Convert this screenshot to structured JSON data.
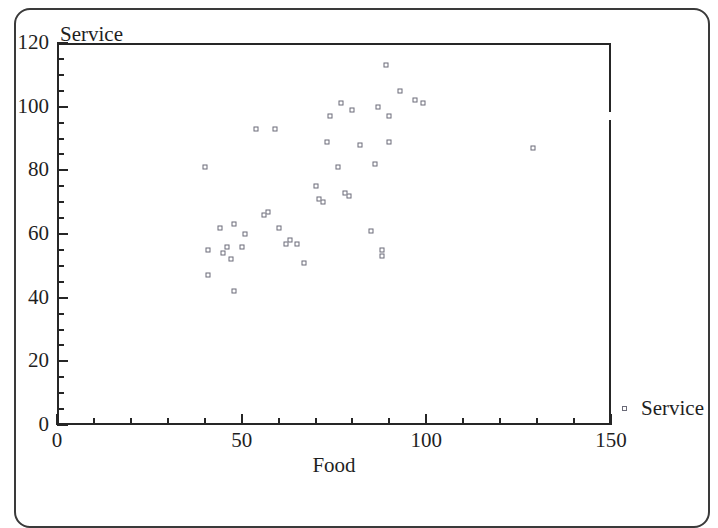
{
  "figure": {
    "title": "",
    "y_axis_title": "Service",
    "x_axis_title": "Food",
    "legend": [
      {
        "marker": "open-square-marker",
        "label": "Service"
      }
    ]
  },
  "chart_data": {
    "type": "scatter",
    "title": "",
    "xlabel": "Food",
    "ylabel": "Service",
    "xlim": [
      0,
      150
    ],
    "ylim": [
      0,
      120
    ],
    "x_major_ticks": [
      0,
      50,
      100,
      150
    ],
    "y_major_ticks": [
      0,
      20,
      40,
      60,
      80,
      100,
      120
    ],
    "x_minor_tick_step": 10,
    "y_minor_tick_step": 5,
    "grid": false,
    "legend_position": "right",
    "marker": "open square",
    "marker_color": "#6b6b78",
    "series": [
      {
        "name": "Service",
        "points": [
          [
            40,
            81
          ],
          [
            41,
            55
          ],
          [
            41,
            47
          ],
          [
            44,
            62
          ],
          [
            45,
            54
          ],
          [
            46,
            56
          ],
          [
            47,
            52
          ],
          [
            48,
            63
          ],
          [
            48,
            42
          ],
          [
            50,
            56
          ],
          [
            51,
            60
          ],
          [
            54,
            93
          ],
          [
            56,
            66
          ],
          [
            57,
            67
          ],
          [
            59,
            93
          ],
          [
            60,
            62
          ],
          [
            62,
            57
          ],
          [
            63,
            58
          ],
          [
            65,
            57
          ],
          [
            67,
            51
          ],
          [
            70,
            75
          ],
          [
            71,
            71
          ],
          [
            72,
            70
          ],
          [
            73,
            89
          ],
          [
            74,
            97
          ],
          [
            76,
            81
          ],
          [
            77,
            101
          ],
          [
            78,
            73
          ],
          [
            79,
            72
          ],
          [
            80,
            99
          ],
          [
            82,
            88
          ],
          [
            85,
            61
          ],
          [
            86,
            82
          ],
          [
            87,
            100
          ],
          [
            88,
            55
          ],
          [
            88,
            53
          ],
          [
            89,
            113
          ],
          [
            90,
            97
          ],
          [
            90,
            89
          ],
          [
            93,
            105
          ],
          [
            97,
            102
          ],
          [
            99,
            101
          ],
          [
            129,
            87
          ]
        ]
      }
    ]
  }
}
